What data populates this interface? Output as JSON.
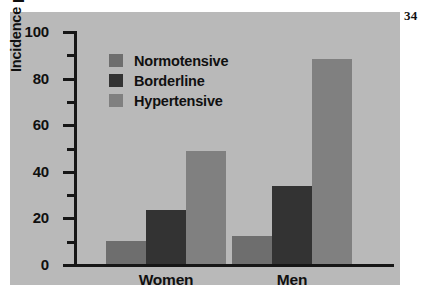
{
  "page_number": "34",
  "figure": {
    "background_color": "#b9b9b9",
    "axis_color": "#161616"
  },
  "chart_data": {
    "type": "bar",
    "title": "",
    "xlabel": "",
    "ylabel": "Incidence per 10,000",
    "ylim": [
      0,
      100
    ],
    "ytick_labels": [
      "0",
      "20",
      "40",
      "60",
      "80",
      "100"
    ],
    "ytick_values": [
      0,
      20,
      40,
      60,
      80,
      100
    ],
    "yminor_values": [
      10,
      30,
      50,
      70,
      90
    ],
    "grid": false,
    "legend_position": "upper left",
    "categories": [
      "Women",
      "Men"
    ],
    "series": [
      {
        "name": "Normotensive",
        "color": "#6e6e6e",
        "values": [
          10,
          12
        ]
      },
      {
        "name": "Borderline",
        "color": "#333333",
        "values": [
          23,
          33.5
        ]
      },
      {
        "name": "Hypertensive",
        "color": "#808080",
        "values": [
          48.5,
          88
        ]
      }
    ]
  }
}
